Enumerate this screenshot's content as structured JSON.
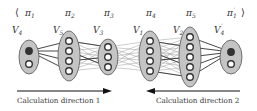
{
  "diagram": {
    "sequence": {
      "open_bracket": "⟨",
      "close_bracket": "⟩",
      "labels": [
        {
          "text": "π",
          "sub": "1",
          "prime": "",
          "x": 29
        },
        {
          "text": "π",
          "sub": "2",
          "prime": "",
          "x": 69
        },
        {
          "text": "π",
          "sub": "3",
          "prime": "",
          "x": 108
        },
        {
          "text": "π",
          "sub": "4",
          "prime": "",
          "x": 150
        },
        {
          "text": "π",
          "sub": "5",
          "prime": "",
          "x": 190
        },
        {
          "text": "π",
          "sub": "1",
          "prime": "′",
          "x": 231
        }
      ]
    },
    "groups": [
      {
        "name": "V",
        "sub": "4",
        "prime": "",
        "label_x": 12,
        "label_y": 33,
        "cx": 29,
        "cy": 57,
        "rx": 10,
        "ry": 17,
        "nodes": [
          51,
          64
        ],
        "dark": 0
      },
      {
        "name": "V",
        "sub": "5",
        "prime": "",
        "label_x": 53,
        "label_y": 33,
        "cx": 69,
        "cy": 56,
        "rx": 11,
        "ry": 25,
        "nodes": [
          41,
          51,
          61,
          71
        ],
        "dark": -1
      },
      {
        "name": "V",
        "sub": "3",
        "prime": "",
        "label_x": 93,
        "label_y": 33,
        "cx": 108,
        "cy": 57,
        "rx": 10,
        "ry": 18,
        "nodes": [
          47,
          57,
          67
        ],
        "dark": -1
      },
      {
        "name": "V",
        "sub": "1",
        "prime": "",
        "label_x": 133,
        "label_y": 33,
        "cx": 150,
        "cy": 56,
        "rx": 11,
        "ry": 25,
        "nodes": [
          41,
          51,
          61,
          71
        ],
        "dark": -1
      },
      {
        "name": "V",
        "sub": "2",
        "prime": "",
        "label_x": 173,
        "label_y": 33,
        "cx": 190,
        "cy": 57,
        "rx": 11,
        "ry": 30,
        "nodes": [
          37,
          47,
          57,
          67,
          77
        ],
        "dark": -1
      },
      {
        "name": "V",
        "sub": "4",
        "prime": "′",
        "label_x": 214,
        "label_y": 33,
        "cx": 231,
        "cy": 57,
        "rx": 11,
        "ry": 17,
        "nodes": [
          52,
          64
        ],
        "dark": 0
      }
    ],
    "directions": [
      {
        "label": "Calculation direction 1",
        "from_x": 17,
        "to_x": 112,
        "y": 91,
        "text_x": 17
      },
      {
        "label": "Calculation direction 2",
        "from_x": 240,
        "to_x": 146,
        "y": 91,
        "text_x": 156
      }
    ],
    "colors": {
      "ellipse_fill": "#c4c4c4",
      "ellipse_stroke": "#555555",
      "node_fill": "#ffffff",
      "node_stroke": "#333333",
      "dark_node": "#333333",
      "edge_bold": "#333333",
      "edge_light": "#9a9a9a",
      "arrow": "#111111"
    }
  }
}
